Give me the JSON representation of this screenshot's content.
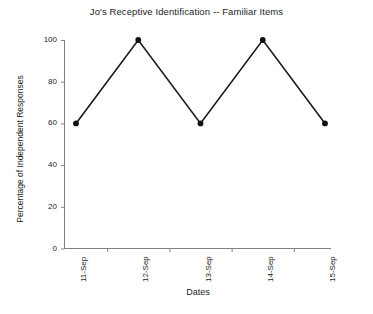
{
  "chart_data": {
    "type": "line",
    "title": "Jo's Receptive Identification -- Familiar Items",
    "xlabel": "Dates",
    "ylabel": "Percentage of Independent Responses",
    "categories": [
      "11-Sep",
      "12-Sep",
      "13-Sep",
      "14-Sep",
      "15-Sep"
    ],
    "values": [
      60,
      100,
      60,
      100,
      60
    ],
    "ylim": [
      0,
      100
    ],
    "yticks": [
      0,
      20,
      40,
      60,
      80,
      100
    ],
    "ytick_labels": [
      "0",
      "20",
      "40",
      "60",
      "80",
      "100"
    ],
    "grid": false,
    "legend": null,
    "series": [
      {
        "name": "Percentage of Independent Responses",
        "values": [
          60,
          100,
          60,
          100,
          60
        ],
        "marker": "filled-circle",
        "line_color": "#1a1a1a",
        "marker_color": "#111111"
      }
    ],
    "colors": {
      "background": "#ffffff",
      "axis": "#808080",
      "line": "#1a1a1a",
      "marker": "#111111",
      "text": "#1d1d1d"
    }
  }
}
